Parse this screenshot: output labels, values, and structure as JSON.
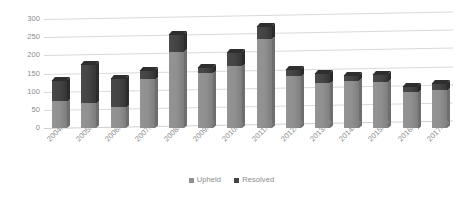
{
  "chart_data": {
    "type": "bar",
    "subtype": "stacked-column-3d",
    "title": "",
    "xlabel": "",
    "ylabel": "",
    "ylim": [
      0,
      300
    ],
    "y_ticks": [
      0,
      50,
      100,
      150,
      200,
      250,
      300
    ],
    "grid": true,
    "legend_position": "bottom",
    "categories": [
      "2004/5",
      "2005/6",
      "2006/7",
      "2007/8",
      "2008/9",
      "2009/10",
      "2010/11",
      "2011/12",
      "2012/13",
      "2013/14",
      "2014/15",
      "2015/16",
      "2016/17",
      "2017/18"
    ],
    "series": [
      {
        "name": "Upheld",
        "color": "#8f8f8f",
        "values": [
          75,
          68,
          58,
          135,
          210,
          152,
          170,
          245,
          143,
          125,
          130,
          128,
          100,
          105
        ]
      },
      {
        "name": "Resolved",
        "color": "#434343",
        "values": [
          58,
          107,
          80,
          25,
          48,
          16,
          38,
          35,
          19,
          27,
          15,
          20,
          17,
          20
        ]
      }
    ],
    "totals": [
      133,
      175,
      138,
      160,
      258,
      168,
      208,
      280,
      162,
      152,
      145,
      148,
      117,
      125
    ]
  },
  "legend": {
    "items": [
      {
        "label": "Upheld",
        "swatch": "upheld-swatch-icon"
      },
      {
        "label": "Resolved",
        "swatch": "resolved-swatch-icon"
      }
    ]
  },
  "axes": {
    "y_tick_labels": [
      "300",
      "250",
      "200",
      "150",
      "100",
      "50",
      "0"
    ],
    "x_tick_labels": [
      "2004/5",
      "2005/6",
      "2006/7",
      "2007/8",
      "2008/9",
      "2009/10",
      "2010/11",
      "2011/12",
      "2012/13",
      "2013/14",
      "2014/15",
      "2015/16",
      "2016/17",
      "2017/18"
    ]
  },
  "colors": {
    "upheld": "#8f8f8f",
    "resolved": "#434343",
    "gridline": "#d9d9d9",
    "text": "#8c8c8c",
    "background": "#ffffff"
  }
}
